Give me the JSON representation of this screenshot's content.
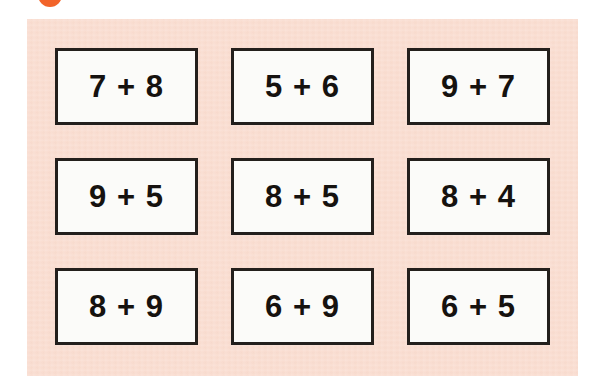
{
  "page": {
    "background_color": "#ffffff",
    "panel_color": "#fadfd3",
    "card_color": "#fbfbf9",
    "card_border_color": "#231f1c",
    "text_color": "#16120f"
  },
  "badge": {
    "label": "2",
    "color": "#f2642a",
    "icon": "number-badge-circle"
  },
  "worksheet": {
    "title": "",
    "rows": 3,
    "columns": 3,
    "cards": [
      {
        "id": "card-1",
        "expression": "7 + 8",
        "left": "7",
        "operator": "+",
        "right": "8",
        "row": 1,
        "column": 1
      },
      {
        "id": "card-2",
        "expression": "5 + 6",
        "left": "5",
        "operator": "+",
        "right": "6",
        "row": 1,
        "column": 2
      },
      {
        "id": "card-3",
        "expression": "9 + 7",
        "left": "9",
        "operator": "+",
        "right": "7",
        "row": 1,
        "column": 3
      },
      {
        "id": "card-4",
        "expression": "9 + 5",
        "left": "9",
        "operator": "+",
        "right": "5",
        "row": 2,
        "column": 1
      },
      {
        "id": "card-5",
        "expression": "8 + 5",
        "left": "8",
        "operator": "+",
        "right": "5",
        "row": 2,
        "column": 2
      },
      {
        "id": "card-6",
        "expression": "8 + 4",
        "left": "8",
        "operator": "+",
        "right": "4",
        "row": 2,
        "column": 3
      },
      {
        "id": "card-7",
        "expression": "8 + 9",
        "left": "8",
        "operator": "+",
        "right": "9",
        "row": 3,
        "column": 1
      },
      {
        "id": "card-8",
        "expression": "6 + 9",
        "left": "6",
        "operator": "+",
        "right": "9",
        "row": 3,
        "column": 2
      },
      {
        "id": "card-9",
        "expression": "6 + 5",
        "left": "6",
        "operator": "+",
        "right": "5",
        "row": 3,
        "column": 3
      }
    ]
  }
}
